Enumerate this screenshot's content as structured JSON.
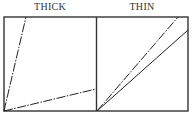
{
  "panels": [
    {
      "label": "THICK",
      "lines": [
        {
          "style": "dash-dot",
          "from": [
            4,
            111
          ],
          "to": [
            26,
            17
          ]
        },
        {
          "style": "dash-dot",
          "from": [
            4,
            111
          ],
          "to": [
            96,
            89
          ]
        }
      ]
    },
    {
      "label": "THIN",
      "lines": [
        {
          "style": "dash-dot",
          "from": [
            97,
            111
          ],
          "to": [
            178,
            17
          ]
        },
        {
          "style": "solid",
          "from": [
            97,
            111
          ],
          "to": [
            188,
            30
          ]
        }
      ]
    }
  ],
  "colors": {
    "line": "#222222",
    "frame": "#333333"
  }
}
